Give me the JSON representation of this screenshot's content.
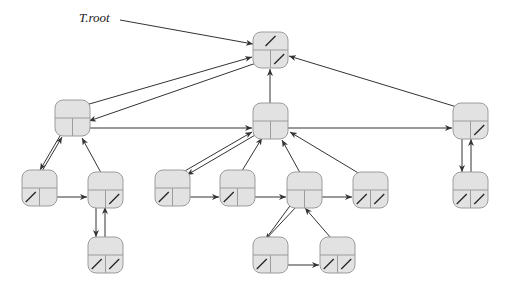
{
  "title_label": "T.root",
  "colors": {
    "node_fill": "#e2e2e2",
    "node_stroke": "#9c9c9c",
    "edge": "#333333"
  },
  "nodes": [
    {
      "id": "root",
      "x": 253,
      "y": 32,
      "top_nil": true,
      "left_nil": false,
      "right_nil": true
    },
    {
      "id": "A",
      "x": 55,
      "y": 100,
      "top_nil": false,
      "left_nil": false,
      "right_nil": false
    },
    {
      "id": "B",
      "x": 253,
      "y": 103,
      "top_nil": false,
      "left_nil": false,
      "right_nil": false
    },
    {
      "id": "C",
      "x": 453,
      "y": 103,
      "top_nil": false,
      "left_nil": false,
      "right_nil": true
    },
    {
      "id": "D",
      "x": 22,
      "y": 170,
      "top_nil": false,
      "left_nil": true,
      "right_nil": false
    },
    {
      "id": "E",
      "x": 88,
      "y": 172,
      "top_nil": false,
      "left_nil": false,
      "right_nil": true
    },
    {
      "id": "F",
      "x": 155,
      "y": 170,
      "top_nil": false,
      "left_nil": true,
      "right_nil": false
    },
    {
      "id": "G",
      "x": 220,
      "y": 170,
      "top_nil": false,
      "left_nil": true,
      "right_nil": false
    },
    {
      "id": "H",
      "x": 287,
      "y": 172,
      "top_nil": false,
      "left_nil": false,
      "right_nil": false
    },
    {
      "id": "I",
      "x": 353,
      "y": 172,
      "top_nil": false,
      "left_nil": true,
      "right_nil": true
    },
    {
      "id": "J",
      "x": 453,
      "y": 172,
      "top_nil": false,
      "left_nil": true,
      "right_nil": true
    },
    {
      "id": "K",
      "x": 88,
      "y": 237,
      "top_nil": false,
      "left_nil": true,
      "right_nil": true
    },
    {
      "id": "L",
      "x": 253,
      "y": 237,
      "top_nil": false,
      "left_nil": true,
      "right_nil": false
    },
    {
      "id": "M",
      "x": 320,
      "y": 237,
      "top_nil": false,
      "left_nil": true,
      "right_nil": true
    }
  ],
  "edges": [
    {
      "from": [
        120,
        20
      ],
      "to": [
        253,
        44
      ],
      "kind": "label-pointer"
    },
    {
      "from": [
        72,
        109
      ],
      "to": [
        252,
        57
      ],
      "kind": "parent"
    },
    {
      "from": [
        262,
        61
      ],
      "to": [
        89,
        121
      ],
      "kind": "left-child"
    },
    {
      "from": [
        270,
        103
      ],
      "to": [
        270,
        69
      ],
      "kind": "parent"
    },
    {
      "from": [
        470,
        111
      ],
      "to": [
        289,
        56
      ],
      "kind": "parent"
    },
    {
      "from": [
        81,
        128
      ],
      "to": [
        252,
        128
      ],
      "kind": "sibling"
    },
    {
      "from": [
        272,
        128
      ],
      "to": [
        452,
        128
      ],
      "kind": "sibling"
    },
    {
      "from": [
        38,
        178
      ],
      "to": [
        62,
        137
      ],
      "kind": "parent"
    },
    {
      "from": [
        64,
        129
      ],
      "to": [
        40,
        170
      ],
      "kind": "left-child"
    },
    {
      "from": [
        105,
        180
      ],
      "to": [
        82,
        138
      ],
      "kind": "parent"
    },
    {
      "from": [
        48,
        197
      ],
      "to": [
        87,
        197
      ],
      "kind": "sibling"
    },
    {
      "from": [
        96,
        206
      ],
      "to": [
        96,
        237
      ],
      "kind": "left-child"
    },
    {
      "from": [
        105,
        245
      ],
      "to": [
        105,
        207
      ],
      "kind": "parent"
    },
    {
      "from": [
        171,
        179
      ],
      "to": [
        252,
        132
      ],
      "kind": "parent"
    },
    {
      "from": [
        262,
        131
      ],
      "to": [
        187,
        175
      ],
      "kind": "left-child"
    },
    {
      "from": [
        237,
        179
      ],
      "to": [
        262,
        138
      ],
      "kind": "parent"
    },
    {
      "from": [
        304,
        180
      ],
      "to": [
        282,
        140
      ],
      "kind": "parent"
    },
    {
      "from": [
        370,
        180
      ],
      "to": [
        290,
        132
      ],
      "kind": "parent"
    },
    {
      "from": [
        181,
        197
      ],
      "to": [
        219,
        197
      ],
      "kind": "sibling"
    },
    {
      "from": [
        246,
        197
      ],
      "to": [
        286,
        197
      ],
      "kind": "sibling"
    },
    {
      "from": [
        313,
        197
      ],
      "to": [
        352,
        197
      ],
      "kind": "sibling"
    },
    {
      "from": [
        462,
        136
      ],
      "to": [
        462,
        172
      ],
      "kind": "left-child"
    },
    {
      "from": [
        471,
        180
      ],
      "to": [
        471,
        139
      ],
      "kind": "parent"
    },
    {
      "from": [
        262,
        244
      ],
      "to": [
        295,
        199
      ],
      "kind": "parent"
    },
    {
      "from": [
        297,
        206
      ],
      "to": [
        265,
        240
      ],
      "kind": "left-child"
    },
    {
      "from": [
        337,
        245
      ],
      "to": [
        305,
        208
      ],
      "kind": "parent"
    },
    {
      "from": [
        279,
        265
      ],
      "to": [
        319,
        265
      ],
      "kind": "sibling"
    }
  ]
}
